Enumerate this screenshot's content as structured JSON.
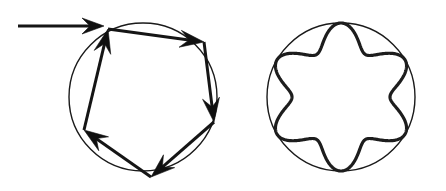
{
  "figure": {
    "background_color": "#ffffff",
    "ink_color": "#151515",
    "width": 446,
    "height": 191,
    "panels": [
      {
        "id": "left-panel",
        "label": "Polygonal billiard orbit with incoming ray",
        "circle": {
          "cx": 143,
          "cy": 97,
          "r": 74,
          "stroke": "#1a1a1a",
          "stroke_width": 1.4
        },
        "incoming_ray": {
          "x1": 18,
          "y1": 26,
          "x2": 104,
          "y2": 26,
          "arrow_at": [
            104,
            26
          ],
          "angle_deg": 0
        },
        "vertices": [
          {
            "name": "v1-top-left",
            "x": 108,
            "y": 29
          },
          {
            "name": "v2-top-right",
            "x": 204,
            "y": 42
          },
          {
            "name": "v3-right-lower",
            "x": 214,
            "y": 122
          },
          {
            "name": "v4-bottom",
            "x": 151,
            "y": 177
          },
          {
            "name": "v5-left-lower",
            "x": 84,
            "y": 130
          }
        ],
        "segments": [
          {
            "name": "segment-1",
            "from": "v1-top-left",
            "to": "v2-top-right",
            "arrow_at_end": true
          },
          {
            "name": "segment-2",
            "from": "v2-top-right",
            "to": "v3-right-lower",
            "arrow_at_end": true
          },
          {
            "name": "segment-3",
            "from": "v3-right-lower",
            "to": "v4-bottom",
            "arrow_at_end": true
          },
          {
            "name": "segment-4",
            "from": "v4-bottom",
            "to": "v5-left-lower",
            "arrow_at_end": true
          },
          {
            "name": "segment-5",
            "from": "v5-left-lower",
            "to": "v1-top-left",
            "arrow_at_end": true
          }
        ],
        "arrow_count": 6,
        "polygon_sides": 5
      },
      {
        "id": "right-panel",
        "label": "Six-lobed caustic envelope inscribed in circle",
        "circle": {
          "cx": 341,
          "cy": 97,
          "r": 74,
          "stroke": "#1a1a1a",
          "stroke_width": 1.4
        },
        "caustic": {
          "type": "hypotrochoid",
          "lobes": 6,
          "outer_radius": 74,
          "inner_radius": 49,
          "stroke": "#1d1d1d",
          "stroke_width": 3.2,
          "tangent_points": 6,
          "phase_deg": -90
        }
      }
    ]
  },
  "chart_data": {
    "type": "scatter",
    "xlabel": "",
    "ylabel": "",
    "series": [
      {
        "name": "left-orbit-vertices",
        "x": [
          108,
          204,
          214,
          151,
          84
        ],
        "y": [
          29,
          42,
          122,
          177,
          130
        ]
      },
      {
        "name": "left-incoming-ray",
        "x": [
          18,
          104
        ],
        "y": [
          26,
          26
        ]
      }
    ],
    "annotations": [
      "left circle center (143, 97) radius 74",
      "right circle center (341, 97) radius 74",
      "right caustic: 6-lobed hypotrochoid, R=74, r=49"
    ]
  }
}
